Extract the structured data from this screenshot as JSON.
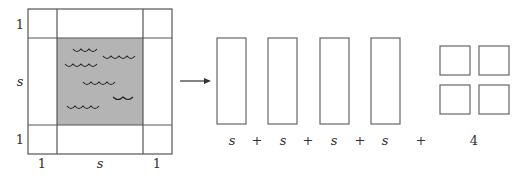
{
  "figure": {
    "main_square": {
      "left_labels": [
        "1",
        "s",
        "1"
      ],
      "bottom_labels": [
        "1",
        "s",
        "1"
      ],
      "pool_fill": "#b4b4b4",
      "stroke": "#555555"
    },
    "arrow": "right-arrow",
    "decomposition": {
      "rectangles": 4,
      "terms": [
        "s",
        "+",
        "s",
        "+",
        "s",
        "+",
        "s",
        "+",
        "4"
      ],
      "unit_squares": 4
    }
  }
}
